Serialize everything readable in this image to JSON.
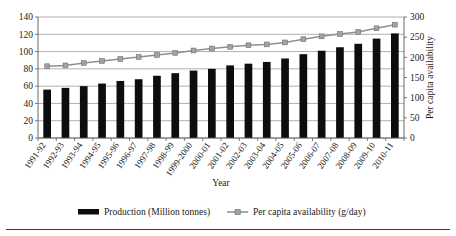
{
  "chart_data": {
    "type": "bar",
    "title": "",
    "xlabel": "Year",
    "ylabel": "",
    "y2label": "Per capita availability",
    "ylim": [
      0,
      140
    ],
    "y2lim": [
      0,
      300
    ],
    "yticks": [
      0,
      20,
      40,
      60,
      80,
      100,
      120,
      140
    ],
    "y2ticks": [
      0,
      50,
      100,
      150,
      200,
      250,
      300
    ],
    "grid": true,
    "legend_position": "bottom",
    "categories": [
      "1991-92",
      "1992-93",
      "1993-94",
      "1994-95",
      "1995-96",
      "1996-97",
      "1997-98",
      "1998-99",
      "1999-2000",
      "2000-01",
      "2001-02",
      "2002-03",
      "2003-04",
      "2004-05",
      "2005-06",
      "2006-07",
      "2007-08",
      "2008-09",
      "2009-10",
      "2010-11"
    ],
    "series": [
      {
        "name": "Production (Million tonnes)",
        "type": "bar",
        "axis": "left",
        "unit": "Million tonnes",
        "color": "#0d0d0d",
        "values": [
          56,
          58,
          60,
          63,
          66,
          68,
          72,
          75,
          78,
          80,
          84,
          86,
          88,
          92,
          97,
          101,
          105,
          109,
          115,
          121
        ]
      },
      {
        "name": "Per capita availability (g/day)",
        "type": "line",
        "axis": "right",
        "unit": "g/day",
        "color": "#a3a3a3",
        "values": [
          178,
          180,
          186,
          191,
          196,
          201,
          206,
          211,
          217,
          222,
          226,
          230,
          232,
          237,
          245,
          252,
          258,
          263,
          272,
          281
        ]
      }
    ]
  },
  "legend": {
    "items": [
      {
        "label": "Production (Million tonnes)",
        "marker": "filled-rect-swatch"
      },
      {
        "label": "Per capita availability (g/day)",
        "marker": "line-square-marker-swatch"
      }
    ]
  }
}
